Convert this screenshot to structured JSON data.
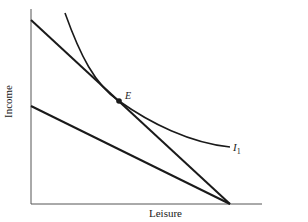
{
  "diagram": {
    "type": "indifference-curve-budget-constraint",
    "axes": {
      "x_label": "Leisure",
      "y_label": "Income"
    },
    "point": {
      "label": "E"
    },
    "curve": {
      "label": "I",
      "subscript": "1"
    },
    "lines": [
      {
        "name": "upper-budget-line",
        "from": [
          31,
          20
        ],
        "to": [
          230,
          204
        ]
      },
      {
        "name": "lower-budget-line",
        "from": [
          31,
          106
        ],
        "to": [
          230,
          204
        ]
      }
    ],
    "colors": {
      "ink": "#1a1a1a",
      "axis": "#555555",
      "background": "#ffffff"
    }
  }
}
